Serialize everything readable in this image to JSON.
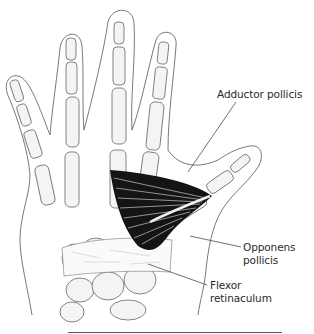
{
  "figure": {
    "labels": {
      "adductor_pollicis": "Adductor pollicis",
      "opponens_line1": "Opponens",
      "opponens_line2": "pollicis",
      "flexor_line1": "Flexor",
      "flexor_line2": "retinaculum"
    },
    "colors": {
      "outline": "#555555",
      "bone_fill": "#f4f4f2",
      "bone_stroke": "#666666",
      "muscle": "#111111",
      "leader_line": "#333333",
      "text": "#2a2a2a"
    }
  }
}
